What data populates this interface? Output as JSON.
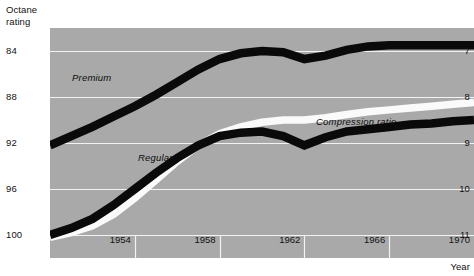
{
  "axes": {
    "y_left_title": "Octane\nrating",
    "x_title": "Year"
  },
  "labels": {
    "premium": "Premium",
    "regular": "Regular",
    "compression": "Compression ratio"
  },
  "ticks": {
    "left": [
      "100",
      "96",
      "92",
      "88",
      "84"
    ],
    "right": [
      "11",
      "10",
      "9",
      "8",
      "7"
    ],
    "bottom": [
      "1954",
      "1958",
      "1962",
      "1966",
      "1970"
    ]
  },
  "colors": {
    "panel": "#a9a9a9",
    "gridline": "#f2f2f2",
    "band_dark": "#0a0a0a",
    "band_light": "#fafafa",
    "text": "#111111",
    "page": "#ffffff"
  },
  "chart_data": {
    "type": "line",
    "title": "",
    "subtitle": "",
    "xlabel": "Year",
    "ylabel": "Octane rating",
    "y2label": "Compression ratio",
    "grid": true,
    "legend": "inline-annotations",
    "x": [
      1950,
      1951,
      1952,
      1953,
      1954,
      1955,
      1956,
      1957,
      1958,
      1959,
      1960,
      1961,
      1962,
      1963,
      1964,
      1965,
      1966,
      1967,
      1968,
      1969,
      1970
    ],
    "xlim": [
      1950,
      1970
    ],
    "ylim_left": [
      82,
      102
    ],
    "ylim_right": [
      6.5,
      11.5
    ],
    "yticks_left": [
      84,
      88,
      92,
      96,
      100
    ],
    "yticks_right": [
      7,
      8,
      9,
      10,
      11
    ],
    "xticks": [
      1954,
      1958,
      1962,
      1966,
      1970
    ],
    "series": [
      {
        "name": "Premium",
        "axis": "left",
        "style": "thick-black-band",
        "values": [
          91.8,
          92.6,
          93.4,
          94.3,
          95.2,
          96.2,
          97.3,
          98.4,
          99.3,
          99.8,
          100.0,
          99.9,
          99.3,
          99.6,
          100.1,
          100.4,
          100.5,
          100.5,
          100.5,
          100.5,
          100.5
        ]
      },
      {
        "name": "Regular",
        "axis": "left",
        "style": "thick-black-band",
        "values": [
          84.0,
          84.6,
          85.4,
          86.6,
          88.0,
          89.4,
          90.7,
          91.8,
          92.6,
          92.9,
          93.0,
          92.6,
          91.8,
          92.5,
          93.0,
          93.2,
          93.4,
          93.6,
          93.7,
          93.9,
          94.0
        ]
      },
      {
        "name": "Compression ratio",
        "axis": "right",
        "style": "thick-white-band",
        "values": [
          6.95,
          7.05,
          7.2,
          7.45,
          7.8,
          8.2,
          8.6,
          8.95,
          9.2,
          9.35,
          9.45,
          9.5,
          9.5,
          9.55,
          9.62,
          9.68,
          9.72,
          9.76,
          9.8,
          9.84,
          9.88
        ]
      }
    ]
  }
}
